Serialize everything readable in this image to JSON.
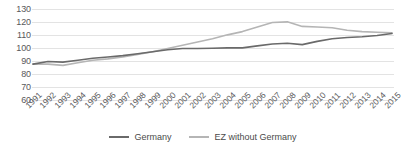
{
  "chart_data": {
    "type": "line",
    "title": "",
    "subtitle": "",
    "xlabel": "",
    "ylabel": "",
    "x": [
      1991,
      1992,
      1993,
      1994,
      1995,
      1996,
      1997,
      1998,
      1999,
      2000,
      2001,
      2002,
      2003,
      2004,
      2005,
      2006,
      2007,
      2008,
      2009,
      2010,
      2011,
      2012,
      2013,
      2014,
      2015
    ],
    "categories": [
      "1991",
      "1992",
      "1993",
      "1994",
      "1995",
      "1996",
      "1997",
      "1998",
      "1999",
      "2000",
      "2001",
      "2002",
      "2003",
      "2004",
      "2005",
      "2006",
      "2007",
      "2008",
      "2009",
      "2010",
      "2011",
      "2012",
      "2013",
      "2014",
      "2015"
    ],
    "series": [
      {
        "name": "Germany",
        "color": "#6a6a6a",
        "values": [
          88.0,
          90.0,
          89.5,
          91.0,
          92.5,
          93.5,
          94.5,
          96.0,
          97.5,
          99.0,
          100.0,
          100.0,
          100.2,
          100.5,
          100.5,
          102.0,
          103.5,
          104.0,
          103.0,
          105.5,
          107.5,
          108.5,
          109.0,
          110.0,
          111.5
        ]
      },
      {
        "name": "EZ without Germany",
        "color": "#b5b5b5",
        "values": [
          88.0,
          88.0,
          87.0,
          89.0,
          91.0,
          92.0,
          93.5,
          95.5,
          97.5,
          100.0,
          102.5,
          105.0,
          107.5,
          110.5,
          113.0,
          116.5,
          120.0,
          120.5,
          117.0,
          116.5,
          116.0,
          114.0,
          113.0,
          112.5,
          112.0
        ]
      }
    ],
    "ylim": [
      60,
      130
    ],
    "ytick_values": [
      130,
      120,
      110,
      100,
      90,
      80,
      70,
      60
    ],
    "ytick_labels": [
      "130",
      "120",
      "110",
      "100",
      "90",
      "80",
      "70",
      "60"
    ],
    "grid": true,
    "grid_color": "#e3e3e3",
    "legend_position": "bottom",
    "legend": [
      {
        "label": "Germany",
        "color": "#6a6a6a"
      },
      {
        "label": "EZ without Germany",
        "color": "#b5b5b5"
      }
    ]
  }
}
